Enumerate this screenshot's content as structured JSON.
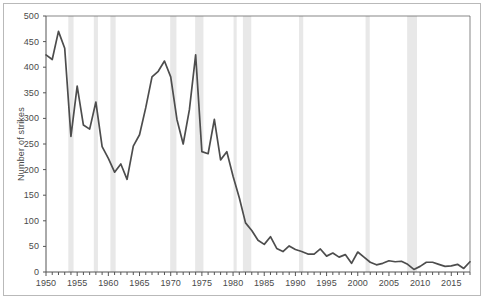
{
  "chart_data": {
    "type": "line",
    "title": "",
    "xlabel": "",
    "ylabel": "Number of strikes",
    "xlim": [
      1950,
      2018
    ],
    "ylim": [
      0,
      500
    ],
    "grid": false,
    "legend": "none",
    "line_color": "#4d4d4d",
    "band_color": "#e8e8e8",
    "axis_color": "#555555",
    "frame_color": "#b9b9b9",
    "background": "#ffffff",
    "y_ticks": [
      0,
      50,
      100,
      150,
      200,
      250,
      300,
      350,
      400,
      450,
      500
    ],
    "x_ticks": [
      1950,
      1955,
      1960,
      1965,
      1970,
      1975,
      1980,
      1985,
      1990,
      1995,
      2000,
      2005,
      2010,
      2015
    ],
    "x_minor_tick_step": 1,
    "series": [
      {
        "name": "Number of strikes",
        "x": [
          1950,
          1951,
          1952,
          1953,
          1954,
          1955,
          1956,
          1957,
          1958,
          1959,
          1960,
          1961,
          1962,
          1963,
          1964,
          1965,
          1966,
          1967,
          1968,
          1969,
          1970,
          1971,
          1972,
          1973,
          1974,
          1975,
          1976,
          1977,
          1978,
          1979,
          1980,
          1981,
          1982,
          1983,
          1984,
          1985,
          1986,
          1987,
          1988,
          1989,
          1990,
          1991,
          1992,
          1993,
          1994,
          1995,
          1996,
          1997,
          1998,
          1999,
          2000,
          2001,
          2002,
          2003,
          2004,
          2005,
          2006,
          2007,
          2008,
          2009,
          2010,
          2011,
          2012,
          2013,
          2014,
          2015,
          2016,
          2017,
          2018
        ],
        "y": [
          424,
          415,
          470,
          437,
          265,
          363,
          287,
          279,
          332,
          245,
          222,
          195,
          211,
          181,
          246,
          268,
          321,
          381,
          392,
          412,
          381,
          298,
          250,
          317,
          424,
          235,
          231,
          298,
          219,
          235,
          187,
          145,
          96,
          81,
          62,
          54,
          69,
          46,
          40,
          51,
          44,
          40,
          35,
          35,
          45,
          31,
          37,
          29,
          34,
          17,
          39,
          29,
          19,
          14,
          17,
          22,
          20,
          21,
          15,
          5,
          11,
          19,
          19,
          15,
          11,
          12,
          15,
          7,
          20
        ]
      }
    ],
    "recession_bands": [
      {
        "start": 1953.58,
        "end": 1954.42
      },
      {
        "start": 1957.67,
        "end": 1958.33
      },
      {
        "start": 1960.33,
        "end": 1961.17
      },
      {
        "start": 1969.92,
        "end": 1970.92
      },
      {
        "start": 1973.92,
        "end": 1975.25
      },
      {
        "start": 1980.08,
        "end": 1980.58
      },
      {
        "start": 1981.58,
        "end": 1982.92
      },
      {
        "start": 1990.58,
        "end": 1991.25
      },
      {
        "start": 2001.25,
        "end": 2001.92
      },
      {
        "start": 2007.92,
        "end": 2009.5
      }
    ]
  }
}
